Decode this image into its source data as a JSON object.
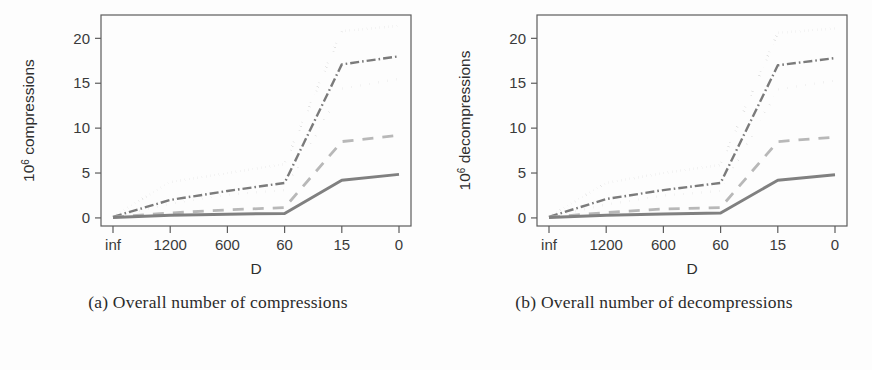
{
  "figure": {
    "background_color": "#fdfdfd",
    "line_color_dark": "#6e6e6e",
    "line_color_mid": "#8a8a8a",
    "line_color_light": "#b3b3b3",
    "axis_color": "#5d5d5d"
  },
  "subfigures": [
    {
      "id": "a",
      "caption": "(a) Overall number of compressions",
      "chart_key": "left"
    },
    {
      "id": "b",
      "caption": "(b) Overall number of decompressions",
      "chart_key": "right"
    }
  ],
  "chart_data": [
    {
      "key": "left",
      "type": "line",
      "title": "",
      "xlabel": "D",
      "ylabel": "10^6 compressions",
      "ylabel_base": "10",
      "ylabel_exp": "6",
      "ylabel_rest": " compressions",
      "categories": [
        "inf",
        "1200",
        "600",
        "60",
        "15",
        "0"
      ],
      "xticklabels": [
        "inf",
        "1200",
        "600",
        "60",
        "15",
        "0"
      ],
      "yticks": [
        0,
        5,
        10,
        15,
        20
      ],
      "yticklabels": [
        "0",
        "5",
        "10",
        "15",
        "20"
      ],
      "ylim": [
        -0.9,
        22.6
      ],
      "grid": false,
      "legend": "none",
      "series": [
        {
          "name": "series-1-dotted-top",
          "style": "dotted",
          "color": "#9a9a9a",
          "width": 2.6,
          "dash": "0.1,4.2",
          "values": [
            0.15,
            4.0,
            5.0,
            6.0,
            20.8,
            21.4
          ]
        },
        {
          "name": "series-2-dashdot",
          "style": "dash-dot",
          "color": "#7b7b7b",
          "width": 2.4,
          "dash": "9,3,1.6,3",
          "values": [
            0.12,
            2.0,
            3.0,
            3.9,
            17.1,
            18.0
          ]
        },
        {
          "name": "series-3-dotted-sparse",
          "style": "dotted-sparse",
          "color": "#8e8e8e",
          "width": 2.4,
          "dash": "0.1,9",
          "values": [
            0.1,
            1.6,
            2.6,
            3.1,
            14.4,
            15.5
          ]
        },
        {
          "name": "series-4-dashed-light",
          "style": "dashed",
          "color": "#b8b8b8",
          "width": 2.8,
          "dash": "11,9",
          "values": [
            0.08,
            0.55,
            0.9,
            1.15,
            8.5,
            9.2
          ]
        },
        {
          "name": "series-5-solid",
          "style": "solid",
          "color": "#808080",
          "width": 3.0,
          "dash": "",
          "values": [
            0.05,
            0.3,
            0.42,
            0.5,
            4.2,
            4.85
          ]
        }
      ]
    },
    {
      "key": "right",
      "type": "line",
      "title": "",
      "xlabel": "D",
      "ylabel": "10^6 decompressions",
      "ylabel_base": "10",
      "ylabel_exp": "6",
      "ylabel_rest": " decompressions",
      "categories": [
        "inf",
        "1200",
        "600",
        "60",
        "15",
        "0"
      ],
      "xticklabels": [
        "inf",
        "1200",
        "600",
        "60",
        "15",
        "0"
      ],
      "yticks": [
        0,
        5,
        10,
        15,
        20
      ],
      "yticklabels": [
        "0",
        "5",
        "10",
        "15",
        "20"
      ],
      "ylim": [
        -0.9,
        22.6
      ],
      "grid": false,
      "legend": "none",
      "series": [
        {
          "name": "series-1-dotted-top",
          "style": "dotted",
          "color": "#9a9a9a",
          "width": 2.6,
          "dash": "0.1,4.2",
          "values": [
            0.15,
            3.9,
            5.0,
            5.9,
            20.6,
            21.1
          ]
        },
        {
          "name": "series-2-dashdot",
          "style": "dash-dot",
          "color": "#7b7b7b",
          "width": 2.4,
          "dash": "9,3,1.6,3",
          "values": [
            0.12,
            2.1,
            3.1,
            3.9,
            17.0,
            17.8
          ]
        },
        {
          "name": "series-3-dotted-sparse",
          "style": "dotted-sparse",
          "color": "#8e8e8e",
          "width": 2.4,
          "dash": "0.1,9",
          "values": [
            0.1,
            1.5,
            2.5,
            3.0,
            14.3,
            15.3
          ]
        },
        {
          "name": "series-4-dashed-light",
          "style": "dashed",
          "color": "#b8b8b8",
          "width": 2.8,
          "dash": "11,9",
          "values": [
            0.08,
            0.6,
            1.0,
            1.15,
            8.5,
            9.0
          ]
        },
        {
          "name": "series-5-solid",
          "style": "solid",
          "color": "#808080",
          "width": 3.0,
          "dash": "",
          "values": [
            0.05,
            0.3,
            0.45,
            0.55,
            4.2,
            4.8
          ]
        }
      ]
    }
  ]
}
